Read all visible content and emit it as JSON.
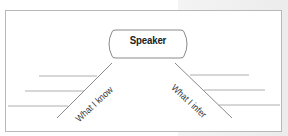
{
  "diagram": {
    "center_node": {
      "label": "Speaker"
    },
    "branches": [
      {
        "label": "What I know",
        "side": "left",
        "blank_lines": 3
      },
      {
        "label": "What I infer",
        "side": "right",
        "blank_lines": 3
      }
    ],
    "colors": {
      "line": "#8a8a8a",
      "frame": "#b8b8b8",
      "text": "#222222"
    }
  }
}
